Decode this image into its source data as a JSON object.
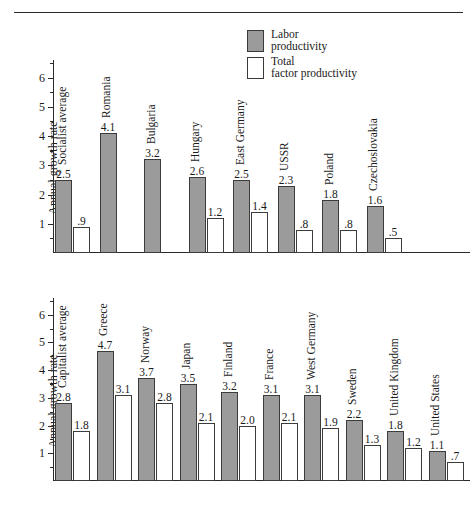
{
  "running_head": "",
  "legend": {
    "items": [
      {
        "swatch": "gray-swatch-icon",
        "line1": "Labor",
        "line2": "productivity",
        "color": "#9b9b9b"
      },
      {
        "swatch": "white-swatch-icon",
        "line1": "Total",
        "line2": "factor productivity",
        "color": "#ffffff"
      }
    ]
  },
  "chart_data": [
    {
      "type": "bar",
      "title": "",
      "xlabel": "",
      "ylabel": "Annual growth rate",
      "ylim": [
        0,
        6.6
      ],
      "yticks": [
        1,
        2,
        3,
        4,
        5,
        6
      ],
      "ytick_labels": [
        "1",
        "2",
        "3",
        "4",
        "5",
        "6"
      ],
      "grid": false,
      "legend_position": "above-right",
      "categories": [
        "Socialist average",
        "Romania",
        "Bulgaria",
        "Hungary",
        "East Germany",
        "USSR",
        "Poland",
        "Czechoslovakia"
      ],
      "series": [
        {
          "name": "Labor productivity",
          "color": "#9b9b9b",
          "values": [
            2.5,
            4.1,
            3.2,
            2.6,
            2.5,
            2.3,
            1.8,
            1.6
          ],
          "labels": [
            "2.5",
            "4.1",
            "3.2",
            "2.6",
            "2.5",
            "2.3",
            "1.8",
            "1.6"
          ]
        },
        {
          "name": "Total factor productivity",
          "color": "#ffffff",
          "values": [
            0.9,
            null,
            null,
            1.2,
            1.4,
            0.8,
            0.8,
            0.5
          ],
          "labels": [
            ".9",
            "",
            "",
            "1.2",
            "1.4",
            ".8",
            ".8",
            ".5"
          ]
        }
      ]
    },
    {
      "type": "bar",
      "title": "",
      "xlabel": "",
      "ylabel": "Annual growth rate",
      "ylim": [
        0,
        6.6
      ],
      "yticks": [
        1,
        2,
        3,
        4,
        5,
        6
      ],
      "ytick_labels": [
        "1",
        "2",
        "3",
        "4",
        "5",
        "6"
      ],
      "grid": false,
      "legend_position": "shared-above",
      "categories": [
        "Capitalist average",
        "Greece",
        "Norway",
        "Japan",
        "Finland",
        "France",
        "West Germany",
        "Sweden",
        "United Kingdom",
        "United States"
      ],
      "series": [
        {
          "name": "Labor productivity",
          "color": "#9b9b9b",
          "values": [
            2.8,
            4.7,
            3.7,
            3.5,
            3.2,
            3.1,
            3.1,
            2.2,
            1.8,
            1.1
          ],
          "labels": [
            "2.8",
            "4.7",
            "3.7",
            "3.5",
            "3.2",
            "3.1",
            "3.1",
            "2.2",
            "1.8",
            "1.1"
          ]
        },
        {
          "name": "Total factor productivity",
          "color": "#ffffff",
          "values": [
            1.8,
            3.1,
            2.8,
            2.1,
            2.0,
            2.1,
            1.9,
            1.3,
            1.2,
            0.7
          ],
          "labels": [
            "1.8",
            "3.1",
            "2.8",
            "2.1",
            "2.0",
            "2.1",
            "1.9",
            "1.3",
            "1.2",
            ".7"
          ]
        }
      ]
    }
  ]
}
